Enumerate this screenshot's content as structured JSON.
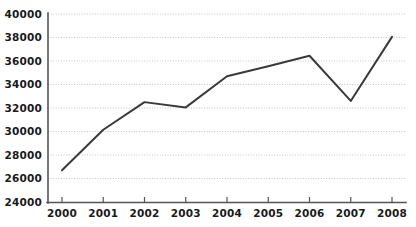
{
  "chart_data": {
    "type": "line",
    "title": "",
    "subtitle": "",
    "xlabel": "",
    "ylabel": "",
    "categories": [
      "2000",
      "2001",
      "2002",
      "2003",
      "2004",
      "2005",
      "2006",
      "2007",
      "2008"
    ],
    "x": [
      2000,
      2001,
      2002,
      2003,
      2004,
      2005,
      2006,
      2007,
      2008
    ],
    "values": [
      26700,
      30150,
      32500,
      32050,
      34700,
      35550,
      36450,
      32600,
      38050
    ],
    "series": [
      {
        "name": "series-1",
        "values": [
          26700,
          30150,
          32500,
          32050,
          34700,
          35550,
          36450,
          32600,
          38050
        ],
        "color": "#3a3a3a"
      }
    ],
    "ylim": [
      24000,
      40000
    ],
    "xlim": [
      2000,
      2008
    ],
    "y_ticks": [
      24000,
      26000,
      28000,
      30000,
      32000,
      34000,
      36000,
      38000,
      40000
    ],
    "y_tick_labels": [
      "24000",
      "26000",
      "28000",
      "30000",
      "32000",
      "34000",
      "36000",
      "38000",
      "40000"
    ],
    "x_ticks": [
      2000,
      2001,
      2002,
      2003,
      2004,
      2005,
      2006,
      2007,
      2008
    ],
    "x_tick_labels": [
      "2000",
      "2001",
      "2002",
      "2003",
      "2004",
      "2005",
      "2006",
      "2007",
      "2008"
    ],
    "grid": true,
    "grid_axis": "y",
    "grid_style": "dotted",
    "legend": false,
    "legend_position": "none",
    "annotations": [],
    "markers": false
  },
  "style": {
    "background": "#ffffff",
    "line_color": "#3a3a3a",
    "grid_color": "#b8b8b8",
    "axis_color": "#555555",
    "label_color": "#1a1a1a"
  },
  "geometry": {
    "plot_left": 48,
    "plot_right": 406,
    "plot_top": 14,
    "plot_bottom": 202,
    "first_tick_x": 62,
    "last_tick_x": 392
  }
}
